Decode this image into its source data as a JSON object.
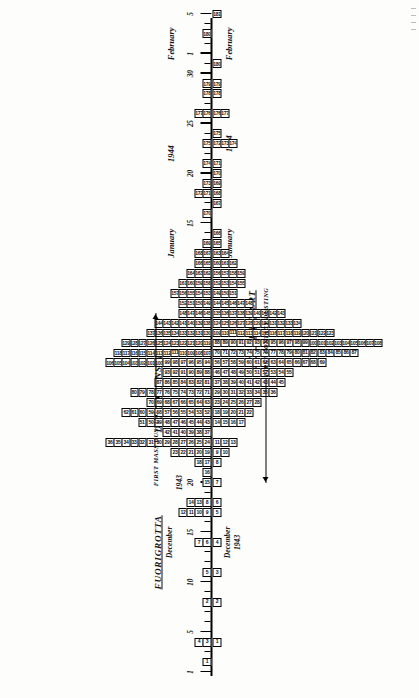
{
  "figure": {
    "location_title": "FUORIGROTTA",
    "onset_axis_title": "DATE OF ONSET",
    "report_axis_title": "DATE OF REPORT",
    "onset_year_1943": "December 1943",
    "onset_year_1944": "1944",
    "report_year_1943": "December 1943",
    "report_year_1944": "1944",
    "month_december": "December",
    "month_january": "January",
    "month_february": "February",
    "year_1943": "1943",
    "year_1944": "1944"
  },
  "annotations": [
    {
      "label": "FIRST CONTACT DUSTING",
      "date": "1943-12-20",
      "side": "report"
    },
    {
      "label": "FIRST MASS DUSTING",
      "date": "1944-01-06",
      "side": "onset"
    }
  ],
  "axis": {
    "start_date": "1943-12-01",
    "end_date": "1944-02-05",
    "tick_interval_days": 1,
    "major_ticks": [
      "1",
      "5",
      "10",
      "15",
      "20",
      "25",
      "30",
      "1",
      "5",
      "10",
      "15",
      "20",
      "25",
      "30",
      "1",
      "5"
    ],
    "major_tick_dates": [
      "1943-12-01",
      "1943-12-05",
      "1943-12-10",
      "1943-12-15",
      "1943-12-20",
      "1943-12-25",
      "1943-12-30",
      "1944-01-01",
      "1944-01-05",
      "1944-01-10",
      "1944-01-15",
      "1944-01-20",
      "1944-01-25",
      "1944-01-30",
      "1944-02-01",
      "1944-02-05"
    ]
  },
  "chart_data": {
    "type": "bar",
    "subtitle": "Each small numbered box represents one case; case serial numbers are printed in the boxes.",
    "xlabel": "Date",
    "ylabel": "Number of cases",
    "grid": false,
    "legend": "none",
    "xlim": [
      "1943-12-01",
      "1944-02-05"
    ],
    "ylim": [
      0,
      22
    ],
    "series": [
      {
        "name": "DATE OF ONSET",
        "direction": "up"
      },
      {
        "name": "DATE OF REPORT",
        "direction": "down"
      }
    ],
    "onset": [
      {
        "date": "1943-12-02",
        "count": 1,
        "ids": [
          "1"
        ]
      },
      {
        "date": "1943-12-04",
        "count": 2,
        "ids": [
          "4",
          "3"
        ]
      },
      {
        "date": "1943-12-08",
        "count": 1,
        "ids": [
          "2"
        ]
      },
      {
        "date": "1943-12-11",
        "count": 1,
        "ids": [
          "5"
        ]
      },
      {
        "date": "1943-12-14",
        "count": 2,
        "ids": [
          "7",
          "6"
        ]
      },
      {
        "date": "1943-12-17",
        "count": 4,
        "ids": [
          "12",
          "11",
          "10",
          "9"
        ]
      },
      {
        "date": "1943-12-18",
        "count": 3,
        "ids": [
          "14",
          "13",
          "8"
        ]
      },
      {
        "date": "1943-12-20",
        "count": 1,
        "ids": [
          "15"
        ]
      },
      {
        "date": "1943-12-21",
        "count": 1,
        "ids": [
          "16"
        ]
      },
      {
        "date": "1943-12-22",
        "count": 2,
        "ids": [
          "18",
          "17"
        ]
      },
      {
        "date": "1943-12-23",
        "count": 5,
        "ids": [
          "23",
          "22",
          "21",
          "20",
          "19"
        ]
      },
      {
        "date": "1943-12-24",
        "count": 13,
        "ids": [
          "36",
          "35",
          "34",
          "33",
          "32",
          "31",
          "30",
          "29",
          "28",
          "27",
          "26",
          "25",
          "24"
        ]
      },
      {
        "date": "1943-12-25",
        "count": 6,
        "ids": [
          "42",
          "41",
          "40",
          "39",
          "38",
          "37"
        ]
      },
      {
        "date": "1943-12-26",
        "count": 9,
        "ids": [
          "51",
          "50",
          "49",
          "48",
          "47",
          "46",
          "45",
          "44",
          "43"
        ]
      },
      {
        "date": "1943-12-27",
        "count": 11,
        "ids": [
          "62",
          "61",
          "60",
          "59",
          "58",
          "57",
          "56",
          "55",
          "54",
          "53",
          "52"
        ]
      },
      {
        "date": "1943-12-28",
        "count": 8,
        "ids": [
          "70",
          "69",
          "68",
          "67",
          "66",
          "65",
          "64",
          "63"
        ]
      },
      {
        "date": "1943-12-29",
        "count": 10,
        "ids": [
          "80",
          "79",
          "78",
          "77",
          "76",
          "75",
          "74",
          "73",
          "72",
          "71"
        ]
      },
      {
        "date": "1943-12-30",
        "count": 7,
        "ids": [
          "87",
          "86",
          "85",
          "84",
          "83",
          "82",
          "81"
        ]
      },
      {
        "date": "1943-12-31",
        "count": 6,
        "ids": [
          "93",
          "92",
          "91",
          "90",
          "89",
          "88"
        ]
      },
      {
        "date": "1944-01-01",
        "count": 13,
        "ids": [
          "106",
          "105",
          "104",
          "103",
          "102",
          "101",
          "100",
          "99",
          "98",
          "97",
          "96",
          "95",
          "94"
        ]
      },
      {
        "date": "1944-01-02",
        "count": 12,
        "ids": [
          "118",
          "117",
          "116",
          "115",
          "114",
          "113",
          "112",
          "111",
          "110",
          "109",
          "108",
          "107"
        ]
      },
      {
        "date": "1944-01-03",
        "count": 11,
        "ids": [
          "129",
          "128",
          "127",
          "126",
          "125",
          "124",
          "123",
          "122",
          "121",
          "120",
          "119"
        ]
      },
      {
        "date": "1944-01-04",
        "count": 8,
        "ids": [
          "137",
          "136",
          "135",
          "134",
          "133",
          "132",
          "131",
          "130"
        ]
      },
      {
        "date": "1944-01-05",
        "count": 7,
        "ids": [
          "144",
          "143",
          "142",
          "141",
          "140",
          "139",
          "138"
        ]
      },
      {
        "date": "1944-01-06",
        "count": 4,
        "ids": [
          "148",
          "147",
          "146",
          "145"
        ]
      },
      {
        "date": "1944-01-07",
        "count": 4,
        "ids": [
          "152",
          "151",
          "150",
          "149"
        ]
      },
      {
        "date": "1944-01-08",
        "count": 5,
        "ids": [
          "157",
          "156",
          "155",
          "154",
          "153"
        ]
      },
      {
        "date": "1944-01-09",
        "count": 4,
        "ids": [
          "161",
          "160",
          "159",
          "158"
        ]
      },
      {
        "date": "1944-01-10",
        "count": 3,
        "ids": [
          "164",
          "163",
          "162"
        ]
      },
      {
        "date": "1944-01-11",
        "count": 2,
        "ids": [
          "166",
          "165"
        ]
      },
      {
        "date": "1944-01-12",
        "count": 2,
        "ids": [
          "168",
          "167"
        ]
      },
      {
        "date": "1944-01-13",
        "count": 1,
        "ids": [
          "169"
        ]
      },
      {
        "date": "1944-01-16",
        "count": 1,
        "ids": [
          "170"
        ]
      },
      {
        "date": "1944-01-18",
        "count": 2,
        "ids": [
          "172",
          "171"
        ]
      },
      {
        "date": "1944-01-19",
        "count": 1,
        "ids": [
          "173"
        ]
      },
      {
        "date": "1944-01-21",
        "count": 1,
        "ids": [
          "174"
        ]
      },
      {
        "date": "1944-01-23",
        "count": 1,
        "ids": [
          "175"
        ]
      },
      {
        "date": "1944-01-26",
        "count": 2,
        "ids": [
          "177",
          "176"
        ]
      },
      {
        "date": "1944-01-28",
        "count": 1,
        "ids": [
          "178"
        ]
      },
      {
        "date": "1944-01-29",
        "count": 1,
        "ids": [
          "179"
        ]
      },
      {
        "date": "1944-02-03",
        "count": 1,
        "ids": [
          "180"
        ]
      }
    ],
    "report": [
      {
        "date": "1943-12-04",
        "count": 1,
        "ids": [
          "1"
        ]
      },
      {
        "date": "1943-12-08",
        "count": 1,
        "ids": [
          "2"
        ]
      },
      {
        "date": "1943-12-11",
        "count": 1,
        "ids": [
          "3"
        ]
      },
      {
        "date": "1943-12-14",
        "count": 1,
        "ids": [
          "4"
        ]
      },
      {
        "date": "1943-12-17",
        "count": 1,
        "ids": [
          "5"
        ]
      },
      {
        "date": "1943-12-18",
        "count": 1,
        "ids": [
          "6"
        ]
      },
      {
        "date": "1943-12-20",
        "count": 1,
        "ids": [
          "7"
        ]
      },
      {
        "date": "1943-12-22",
        "count": 1,
        "ids": [
          "8"
        ]
      },
      {
        "date": "1943-12-23",
        "count": 2,
        "ids": [
          "9",
          "10"
        ]
      },
      {
        "date": "1943-12-24",
        "count": 3,
        "ids": [
          "11",
          "12",
          "13"
        ]
      },
      {
        "date": "1943-12-26",
        "count": 4,
        "ids": [
          "14",
          "15",
          "16",
          "17"
        ]
      },
      {
        "date": "1943-12-27",
        "count": 5,
        "ids": [
          "18",
          "19",
          "20",
          "21",
          "22"
        ]
      },
      {
        "date": "1943-12-28",
        "count": 6,
        "ids": [
          "23",
          "24",
          "25",
          "26",
          "27",
          "28"
        ]
      },
      {
        "date": "1943-12-29",
        "count": 8,
        "ids": [
          "29",
          "30",
          "31",
          "32",
          "33",
          "34",
          "35",
          "36"
        ]
      },
      {
        "date": "1943-12-30",
        "count": 9,
        "ids": [
          "37",
          "38",
          "39",
          "40",
          "41",
          "42",
          "43",
          "44",
          "45"
        ]
      },
      {
        "date": "1943-12-31",
        "count": 10,
        "ids": [
          "46",
          "47",
          "48",
          "49",
          "50",
          "51",
          "52",
          "53",
          "54",
          "55"
        ]
      },
      {
        "date": "1944-01-01",
        "count": 14,
        "ids": [
          "56",
          "57",
          "58",
          "59",
          "60",
          "61",
          "62",
          "63",
          "64",
          "65",
          "66",
          "67",
          "68",
          "69"
        ]
      },
      {
        "date": "1944-01-02",
        "count": 18,
        "ids": [
          "70",
          "71",
          "72",
          "73",
          "74",
          "75",
          "76",
          "77",
          "78",
          "79",
          "80",
          "81",
          "82",
          "83",
          "84",
          "85",
          "86",
          "87"
        ]
      },
      {
        "date": "1944-01-03",
        "count": 21,
        "ids": [
          "88",
          "89",
          "90",
          "91",
          "92",
          "93",
          "94",
          "95",
          "96",
          "97",
          "98",
          "99",
          "100",
          "101",
          "102",
          "103",
          "104",
          "105",
          "106",
          "107",
          "108"
        ]
      },
      {
        "date": "1944-01-04",
        "count": 15,
        "ids": [
          "109",
          "110",
          "111",
          "112",
          "113",
          "114",
          "115",
          "116",
          "117",
          "118",
          "119",
          "120",
          "121",
          "122",
          "123"
        ]
      },
      {
        "date": "1944-01-05",
        "count": 11,
        "ids": [
          "124",
          "125",
          "126",
          "127",
          "128",
          "129",
          "130",
          "131",
          "132",
          "133",
          "134"
        ]
      },
      {
        "date": "1944-01-06",
        "count": 9,
        "ids": [
          "135",
          "136",
          "137",
          "138",
          "139",
          "140",
          "141",
          "142",
          "143"
        ]
      },
      {
        "date": "1944-01-07",
        "count": 5,
        "ids": [
          "144",
          "145",
          "146",
          "147",
          "148"
        ]
      },
      {
        "date": "1944-01-08",
        "count": 3,
        "ids": [
          "149",
          "150",
          "151"
        ]
      },
      {
        "date": "1944-01-09",
        "count": 4,
        "ids": [
          "152",
          "153",
          "154",
          "155"
        ]
      },
      {
        "date": "1944-01-10",
        "count": 4,
        "ids": [
          "156",
          "157",
          "158",
          "159"
        ]
      },
      {
        "date": "1944-01-11",
        "count": 3,
        "ids": [
          "160",
          "161",
          "162"
        ]
      },
      {
        "date": "1944-01-12",
        "count": 2,
        "ids": [
          "163",
          "164"
        ]
      },
      {
        "date": "1944-01-13",
        "count": 1,
        "ids": [
          "165"
        ]
      },
      {
        "date": "1944-01-14",
        "count": 1,
        "ids": [
          "166"
        ]
      },
      {
        "date": "1944-01-17",
        "count": 1,
        "ids": [
          "167"
        ]
      },
      {
        "date": "1944-01-18",
        "count": 1,
        "ids": [
          "168"
        ]
      },
      {
        "date": "1944-01-19",
        "count": 1,
        "ids": [
          "169"
        ]
      },
      {
        "date": "1944-01-20",
        "count": 1,
        "ids": [
          "170"
        ]
      },
      {
        "date": "1944-01-21",
        "count": 1,
        "ids": [
          "171"
        ]
      },
      {
        "date": "1944-01-23",
        "count": 3,
        "ids": [
          "172",
          "173",
          "174"
        ]
      },
      {
        "date": "1944-01-24",
        "count": 1,
        "ids": [
          "175"
        ]
      },
      {
        "date": "1944-01-26",
        "count": 2,
        "ids": [
          "176",
          "177"
        ]
      },
      {
        "date": "1944-01-28",
        "count": 1,
        "ids": [
          "178"
        ]
      },
      {
        "date": "1944-01-29",
        "count": 1,
        "ids": [
          "179"
        ]
      },
      {
        "date": "1944-01-31",
        "count": 1,
        "ids": [
          "180"
        ]
      },
      {
        "date": "1944-02-05",
        "count": 1,
        "ids": [
          "181"
        ]
      }
    ]
  }
}
